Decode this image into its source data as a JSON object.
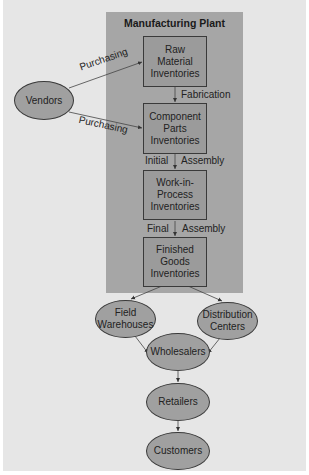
{
  "diagram": {
    "plant_title": "Manufacturing Plant",
    "boxes": [
      {
        "id": "raw",
        "label": "Raw\nMaterial\nInventories"
      },
      {
        "id": "component",
        "label": "Component\nParts\nInventories"
      },
      {
        "id": "wip",
        "label": "Work-in-\nProcess\nInventories"
      },
      {
        "id": "finished",
        "label": "Finished\nGoods\nInventories"
      }
    ],
    "nodes": {
      "vendors": "Vendors",
      "field_warehouses": "Field\nWarehouses",
      "distribution_centers": "Distribution\nCenters",
      "wholesalers": "Wholesalers",
      "retailers": "Retailers",
      "customers": "Customers"
    },
    "edge_labels": {
      "purchasing_1": "Purchasing",
      "purchasing_2": "Purchasing",
      "fabrication": "Fabrication",
      "initial": "Initial",
      "assembly_1": "Assembly",
      "final": "Final",
      "assembly_2": "Assembly"
    },
    "colors": {
      "background": "#e6e6e6",
      "plant_panel": "#a6a6a6",
      "node_fill": "#a0a0a0",
      "outline": "#3a3a3a"
    }
  }
}
